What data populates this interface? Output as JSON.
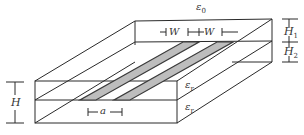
{
  "diagram": {
    "type": "coupled microstrip lines, 3D substrate cross-section",
    "colors": {
      "line": "#2a2a2a",
      "strip": "#3a3a3a",
      "background": "#ffffff"
    },
    "labels": {
      "eps0": {
        "sym": "ε",
        "sub": "0"
      },
      "eps_r_top": {
        "sym": "ε",
        "sub": "r"
      },
      "eps_r_bottom": {
        "sym": "ε",
        "sub": "r"
      },
      "w1": "W",
      "w2": "W",
      "h1": {
        "sym": "H",
        "sub": "1"
      },
      "h2": {
        "sym": "H",
        "sub": "2"
      },
      "h": "H",
      "a": "a"
    }
  }
}
